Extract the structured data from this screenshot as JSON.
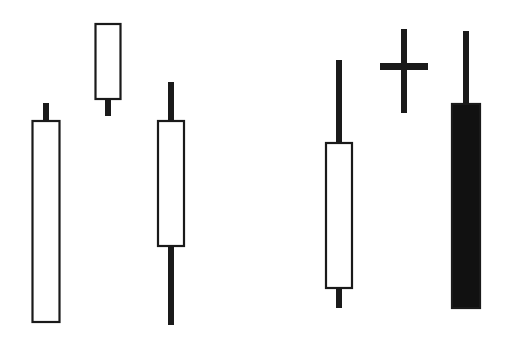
{
  "chart_data": {
    "type": "candlestick",
    "title": "",
    "xlabel": "",
    "ylabel": "",
    "grid": false,
    "legend": null,
    "axes_visible": false,
    "colors": {
      "background": "#ffffff",
      "outline": "#1a1a1a",
      "bullish_fill": "#ffffff",
      "bearish_fill": "#111111",
      "wick": "#1a1a1a"
    },
    "candles": [
      {
        "id": "c1",
        "kind": "bullish",
        "x": 46,
        "body_width": 29,
        "high": 103,
        "body_top": 120,
        "body_bottom": 323,
        "low": 323
      },
      {
        "id": "c2",
        "kind": "bullish",
        "x": 108,
        "body_width": 27,
        "high": 23,
        "body_top": 23,
        "body_bottom": 100,
        "low": 116
      },
      {
        "id": "c3",
        "kind": "bullish",
        "x": 171,
        "body_width": 28,
        "high": 82,
        "body_top": 120,
        "body_bottom": 247,
        "low": 325
      },
      {
        "id": "c4",
        "kind": "bullish",
        "x": 339,
        "body_width": 28,
        "high": 60,
        "body_top": 142,
        "body_bottom": 289,
        "low": 308
      },
      {
        "id": "c5",
        "kind": "doji",
        "x": 404,
        "body_width": 48,
        "high": 29,
        "body_top": 63,
        "body_bottom": 70,
        "low": 113
      },
      {
        "id": "c6",
        "kind": "bearish",
        "x": 466,
        "body_width": 30,
        "high": 31,
        "body_top": 103,
        "body_bottom": 309,
        "low": 309
      }
    ],
    "note": "Values are pixel positions in the 508x341 image (y grows downward); no price axis is shown."
  }
}
